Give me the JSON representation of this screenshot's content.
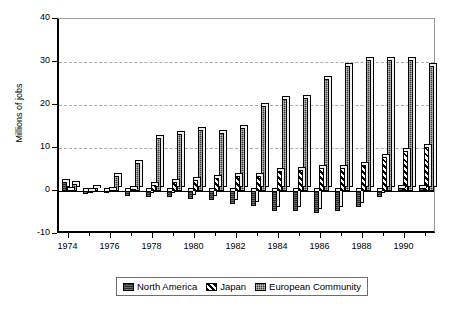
{
  "chart_data": {
    "type": "bar",
    "title": "",
    "xlabel": "",
    "ylabel": "Millions of jobs",
    "ylim": [
      -10,
      40
    ],
    "yticks": [
      -10,
      0,
      10,
      20,
      30,
      40
    ],
    "ytick_labels": [
      "-10",
      "0",
      "10",
      "20",
      "30",
      "40"
    ],
    "grid": true,
    "gridlines": [
      10,
      20,
      30
    ],
    "legend_position": "bottom",
    "categories": [
      1974,
      1975,
      1976,
      1977,
      1978,
      1979,
      1980,
      1981,
      1982,
      1983,
      1984,
      1985,
      1986,
      1987,
      1988,
      1989,
      1990,
      1991
    ],
    "xtick_labels": [
      "1974",
      "1976",
      "1978",
      "1980",
      "1982",
      "1984",
      "1986",
      "1988",
      "1990"
    ],
    "xtick_values": [
      1974,
      1976,
      1978,
      1980,
      1982,
      1984,
      1986,
      1988,
      1990
    ],
    "series": [
      {
        "name": "North America",
        "pattern": "solid-dark",
        "color": "#2b2b2b",
        "values": [
          2.0,
          -0.6,
          -0.5,
          -1.2,
          -1.5,
          -1.4,
          -1.8,
          -2.2,
          -3.0,
          -3.6,
          -4.6,
          -4.6,
          -5.0,
          -4.6,
          -3.8,
          -1.4,
          0.6,
          0.6
        ]
      },
      {
        "name": "Japan",
        "pattern": "diagonal-hatch",
        "color": "#000000",
        "values": [
          0.2,
          0.1,
          0.3,
          0.4,
          1.5,
          2.0,
          2.6,
          3.0,
          3.4,
          3.6,
          4.7,
          5.0,
          5.3,
          5.4,
          6.0,
          8.0,
          9.4,
          10.3
        ]
      },
      {
        "name": "European Community",
        "pattern": "dotted-dark",
        "color": "#3a3a3a",
        "values": [
          1.6,
          0.6,
          3.4,
          6.6,
          12.4,
          13.2,
          14.2,
          13.6,
          14.6,
          19.8,
          21.3,
          21.6,
          26.0,
          29.0,
          30.4,
          30.4,
          30.5,
          29.0
        ]
      }
    ]
  },
  "legend": {
    "items": [
      {
        "label": "North America"
      },
      {
        "label": "Japan"
      },
      {
        "label": "European Community"
      }
    ]
  }
}
